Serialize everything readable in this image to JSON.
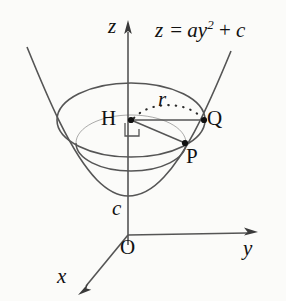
{
  "figure": {
    "kind": "3d-paraboloid-diagram",
    "width": 286,
    "height": 301,
    "background_color": "#fbfbf9",
    "stroke_color": "#555555",
    "text_color": "#111111"
  },
  "axes": {
    "z_label": "z",
    "y_label": "y",
    "x_label": "x",
    "origin_label": "O"
  },
  "equation": {
    "lhs": "z",
    "equals": "=",
    "coefficient": "a",
    "variable": "y",
    "exponent": "2",
    "plus": "+",
    "constant": "c"
  },
  "labels": {
    "vertex_height": "c",
    "center_point": "H",
    "rim_point": "Q",
    "surface_point": "P",
    "radius": "r"
  },
  "geometry": {
    "origin": {
      "x": 128,
      "y": 235
    },
    "z_axis_top": {
      "x": 128,
      "y": 22
    },
    "y_axis_end": {
      "x": 256,
      "y": 232
    },
    "x_axis_end": {
      "x": 80,
      "y": 291
    },
    "parabola_vertex": {
      "x": 128,
      "y": 196
    },
    "rim_ellipse": {
      "cx": 131,
      "cy": 120,
      "rx": 74,
      "ry": 37
    },
    "lower_ellipse": {
      "cx": 131,
      "cy": 143,
      "rx": 55,
      "ry": 28
    },
    "point_H": {
      "x": 131,
      "y": 120
    },
    "point_Q": {
      "x": 204,
      "y": 120
    },
    "point_P": {
      "x": 185,
      "y": 143
    }
  }
}
